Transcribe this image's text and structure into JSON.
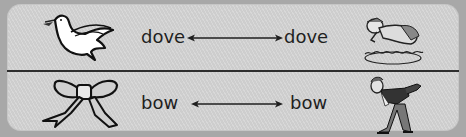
{
  "rows": [
    {
      "left_image": "dove-bird-icon",
      "left_word": "dove",
      "arrow": "double-headed-arrow",
      "right_word": "dove",
      "right_image": "diving-man-icon"
    },
    {
      "left_image": "ribbon-bow-icon",
      "left_word": "bow",
      "arrow": "double-headed-arrow",
      "right_word": "bow",
      "right_image": "bowing-man-icon"
    }
  ],
  "colors": {
    "background": "#a8a8a8",
    "panel": "#d4d4d4",
    "divider": "#2e2e2e",
    "text": "#1f1f1f"
  }
}
